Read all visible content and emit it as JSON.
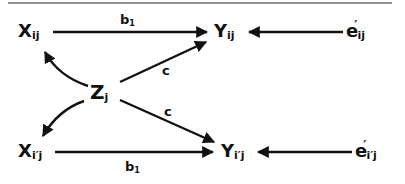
{
  "diagram": {
    "type": "path-diagram",
    "border_top": true,
    "nodes": {
      "x_ij": {
        "base": "X",
        "sub": "ij"
      },
      "y_ij": {
        "base": "Y",
        "sub": "ij"
      },
      "e_ij": {
        "base": "e",
        "prime": "′",
        "sub": "ij"
      },
      "z_j": {
        "base": "Z",
        "sub": "j"
      },
      "x_ipj": {
        "base": "X",
        "sub": "i′j"
      },
      "y_ipj": {
        "base": "Y",
        "sub": "i′j"
      },
      "e_ipj": {
        "base": "e",
        "prime": "′",
        "sub": "i′j"
      }
    },
    "edges": [
      {
        "from": "X_ij",
        "to": "Y_ij",
        "label": "b",
        "label_sub": "1"
      },
      {
        "from": "e'_ij",
        "to": "Y_ij",
        "label": ""
      },
      {
        "from": "Z_j",
        "to": "X_ij",
        "label": ""
      },
      {
        "from": "Z_j",
        "to": "Y_ij",
        "label": "c"
      },
      {
        "from": "Z_j",
        "to": "X_i'j",
        "label": ""
      },
      {
        "from": "Z_j",
        "to": "Y_i'j",
        "label": "c"
      },
      {
        "from": "X_i'j",
        "to": "Y_i'j",
        "label": "b",
        "label_sub": "1"
      },
      {
        "from": "e'_i'j",
        "to": "Y_i'j",
        "label": ""
      }
    ],
    "labels": {
      "b1_top": {
        "base": "b",
        "sub": "1"
      },
      "b1_bot": {
        "base": "b",
        "sub": "1"
      },
      "c_top": "c",
      "c_bot": "c"
    },
    "colors": {
      "ink": "#111111",
      "background": "#ffffff"
    }
  }
}
